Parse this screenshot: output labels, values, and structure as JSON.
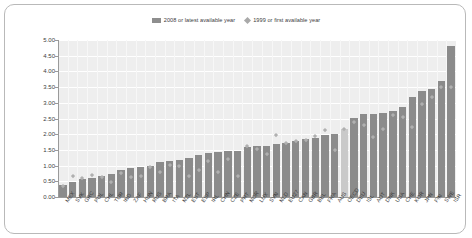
{
  "legend": {
    "position": "top-center",
    "entries": [
      {
        "marker": "bar-swatch-icon",
        "label": "2008 or latest available year",
        "color": "#8b8b8b"
      },
      {
        "marker": "diamond-marker-icon",
        "label": "1999 or first available year",
        "color": "#b0b0b0"
      }
    ]
  },
  "chart_data": {
    "type": "bar",
    "title": "",
    "subtitle": "",
    "xlabel": "",
    "ylabel": "",
    "ylim": [
      0.0,
      5.0
    ],
    "ytick_labels": [
      "0.00",
      "0.50",
      "1.00",
      "1.50",
      "2.00",
      "2.50",
      "3.00",
      "3.50",
      "4.00",
      "4.50",
      "5.00"
    ],
    "ytick_values": [
      0.0,
      0.5,
      1.0,
      1.5,
      2.0,
      2.5,
      3.0,
      3.5,
      4.0,
      4.5,
      5.0
    ],
    "grid": true,
    "highlight_category": "OECD",
    "highlight_color": "#c9c9c9",
    "bar_color": "#8b8b8b",
    "marker_color": "#b0b0b0",
    "plot_background": "#eeeeee",
    "categories": [
      "MEX",
      "SVK",
      "GRC",
      "POL",
      "CHL",
      "TUR",
      "IND",
      "ZAF",
      "HUN",
      "RUS",
      "BRA",
      "ITA",
      "NZL",
      "EST",
      "ESP",
      "IRL",
      "CHN",
      "CZE",
      "PRT",
      "NOR",
      "LUX",
      "SVN",
      "NLD",
      "EU27",
      "CAN",
      "GBR",
      "BEL",
      "FRA",
      "AUS",
      "OECD",
      "DEU",
      "ISL",
      "AUT",
      "DNK",
      "USA",
      "CHE",
      "KOR",
      "JPN",
      "FIN",
      "SWE",
      "ISR"
    ],
    "series": [
      {
        "name": "2008 or latest available year",
        "type": "bar",
        "values": [
          0.37,
          0.47,
          0.58,
          0.6,
          0.67,
          0.72,
          0.86,
          0.92,
          0.95,
          1.0,
          1.12,
          1.15,
          1.17,
          1.25,
          1.33,
          1.41,
          1.43,
          1.45,
          1.47,
          1.6,
          1.63,
          1.63,
          1.68,
          1.73,
          1.78,
          1.85,
          1.88,
          1.99,
          2.02,
          2.18,
          2.51,
          2.64,
          2.64,
          2.69,
          2.74,
          2.86,
          3.18,
          3.39,
          3.44,
          3.68,
          4.8
        ]
      },
      {
        "name": "1999 or first available year",
        "type": "scatter",
        "marker": "diamond",
        "values": [
          0.35,
          0.65,
          0.59,
          0.68,
          0.63,
          0.48,
          0.74,
          0.62,
          0.65,
          0.95,
          0.78,
          1.01,
          0.97,
          0.65,
          0.85,
          1.14,
          0.78,
          1.19,
          0.67,
          1.62,
          1.52,
          1.37,
          1.95,
          1.72,
          1.78,
          1.8,
          1.92,
          2.13,
          1.47,
          2.15,
          2.38,
          2.29,
          1.89,
          2.16,
          2.6,
          2.53,
          2.22,
          2.96,
          3.16,
          3.5,
          3.5
        ]
      }
    ]
  }
}
